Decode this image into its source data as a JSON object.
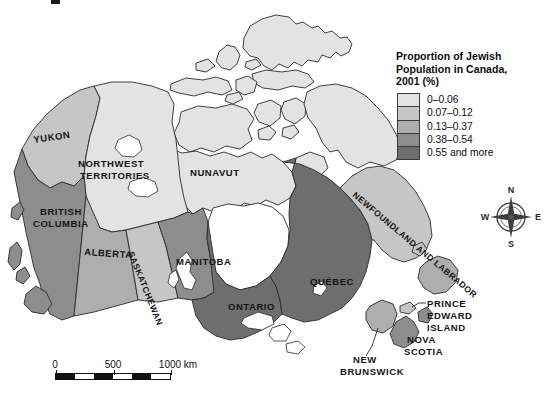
{
  "map": {
    "title_fragment": "",
    "regions": [
      {
        "id": "yukon",
        "label": "YUKON",
        "class_index": 1
      },
      {
        "id": "nwt",
        "label": "NORTHWEST\nTERRITORIES",
        "class_index": 0
      },
      {
        "id": "nunavut",
        "label": "NUNAVUT",
        "class_index": 0
      },
      {
        "id": "bc",
        "label": "BRITISH\nCOLUMBIA",
        "class_index": 3
      },
      {
        "id": "alberta",
        "label": "ALBERTA",
        "class_index": 2
      },
      {
        "id": "saskatchewan",
        "label": "SASKATCHEWAN",
        "class_index": 1
      },
      {
        "id": "manitoba",
        "label": "MANITOBA",
        "class_index": 3
      },
      {
        "id": "ontario",
        "label": "ONTARIO",
        "class_index": 4
      },
      {
        "id": "quebec",
        "label": "QUÉBEC",
        "class_index": 4
      },
      {
        "id": "nl",
        "label": "NEWFOUNDLAND AND LABRADOR",
        "class_index": 1
      },
      {
        "id": "nb",
        "label": "NEW\nBRUNSWICK",
        "class_index": 2
      },
      {
        "id": "ns",
        "label": "NOVA\nSCOTIA",
        "class_index": 3
      },
      {
        "id": "pei",
        "label": "PRINCE\nEDWARD\nISLAND",
        "class_index": 1
      }
    ]
  },
  "legend": {
    "title": "Proportion of Jewish\nPopulation in Canada,\n2001 (%)",
    "entries": [
      {
        "label": "0–0.06",
        "color": "#e3e3e3"
      },
      {
        "label": "0.07–0.12",
        "color": "#c6c6c6"
      },
      {
        "label": "0.13–0.37",
        "color": "#aeaeae"
      },
      {
        "label": "0.38–0.54",
        "color": "#8d8d8d"
      },
      {
        "label": "0.55 and more",
        "color": "#6e6e6e"
      }
    ]
  },
  "scale": {
    "ticks": [
      "0",
      "500",
      "1000 km"
    ],
    "segments": 6
  },
  "compass": {
    "north": "N",
    "east": "E",
    "south": "S",
    "west": "W"
  },
  "colors": {
    "ocean": "#ffffff",
    "outline": "#2b2b2b",
    "text": "#111111"
  }
}
